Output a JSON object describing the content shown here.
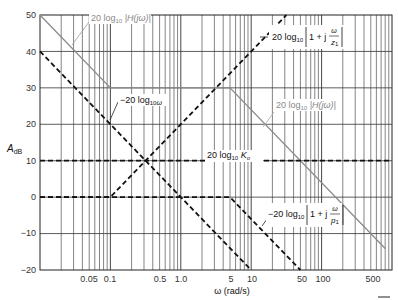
{
  "chart_data": {
    "type": "line",
    "title": "",
    "xlabel": "ω (rad/s)",
    "ylabel": "A_dB",
    "xscale": "log",
    "xlim": [
      0.01,
      1000
    ],
    "ylim": [
      -20,
      50
    ],
    "grid": true,
    "x_tick_labels": [
      "0.05",
      "0.1",
      "0.5",
      "1.0",
      "5",
      "10",
      "50",
      "100",
      "500"
    ],
    "x_tick_values": [
      0.05,
      0.1,
      0.5,
      1.0,
      5,
      10,
      50,
      100,
      500
    ],
    "y_tick_labels": [
      "50",
      "40",
      "30",
      "20",
      "10",
      "0",
      "−10",
      "−20"
    ],
    "y_tick_values": [
      50,
      40,
      30,
      20,
      10,
      0,
      -10,
      -20
    ],
    "series": [
      {
        "name": "20 log10 |H(jω)|",
        "style": "solid-grey",
        "x": [
          0.01,
          0.1,
          5,
          800
        ],
        "y": [
          50,
          30,
          30,
          -14.1
        ]
      },
      {
        "name": "−20 log10 ω",
        "style": "dashed",
        "x": [
          0.01,
          10
        ],
        "y": [
          40,
          -20
        ]
      },
      {
        "name": "20 log10 |1 + jω/z1|",
        "style": "dashed",
        "x": [
          0.01,
          0.1,
          31.6
        ],
        "y": [
          0,
          0,
          50
        ]
      },
      {
        "name": "20 log10 Ko",
        "style": "dashed",
        "x": [
          0.01,
          1000
        ],
        "y": [
          10,
          10
        ]
      },
      {
        "name": "−20 log10 |1 + jω/p1|",
        "style": "dashed",
        "x": [
          0.01,
          5,
          50
        ],
        "y": [
          0,
          0,
          -20
        ]
      }
    ],
    "annotations": [
      "20 log10 |H(jω)|",
      "−20 log10 ω",
      "20 log10 |1 + j ω/z1|",
      "20 log10 Ko",
      "20 log10 |H(jω)|",
      "−20 log10 |1 + j ω/p1|"
    ]
  },
  "labels": {
    "xlabel": "ω (rad/s)",
    "ylabel_main": "A",
    "ylabel_sub": "dB",
    "ann_H_top": "20 log",
    "ann_H_top_sub": "10",
    "ann_H_top_tail": " |H(jω)|",
    "ann_omega": "−20 log",
    "ann_omega_sub": "10",
    "ann_omega_tail": "ω",
    "ann_z1": "20 log",
    "ann_z1_sub": "10",
    "ann_z1_mid": "1 + j",
    "ann_z1_num": "ω",
    "ann_z1_den": "z",
    "ann_z1_den_sub": "1",
    "ann_Ko": "20 log",
    "ann_Ko_sub": "10",
    "ann_Ko_tail": " K",
    "ann_Ko_tail_sub": "o",
    "ann_H_right": "20 log",
    "ann_H_right_sub": "10",
    "ann_H_right_tail": " |H(jω)|",
    "ann_p1": "−20 log",
    "ann_p1_sub": "10",
    "ann_p1_mid": "1 + j",
    "ann_p1_num": "ω",
    "ann_p1_den": "p",
    "ann_p1_den_sub": "1"
  },
  "ticks": {
    "y": [
      "50",
      "40",
      "30",
      "20",
      "10",
      "0",
      "−10",
      "−20"
    ],
    "x": [
      "0.05",
      "0.1",
      "0.5",
      "1.0",
      "5",
      "10",
      "50",
      "100",
      "500"
    ]
  }
}
